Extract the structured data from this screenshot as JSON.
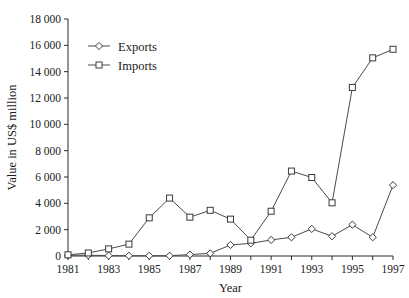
{
  "chart_data": {
    "type": "line",
    "title": "",
    "xlabel": "Year",
    "ylabel": "Value in US$ million",
    "x": [
      1981,
      1982,
      1983,
      1984,
      1985,
      1986,
      1987,
      1988,
      1989,
      1990,
      1991,
      1992,
      1993,
      1994,
      1995,
      1996,
      1997
    ],
    "xtick_labels": [
      "1981",
      "1983",
      "1985",
      "1987",
      "1989",
      "1991",
      "1993",
      "1995",
      "1997"
    ],
    "xtick_values": [
      1981,
      1983,
      1985,
      1987,
      1989,
      1991,
      1993,
      1995,
      1997
    ],
    "xlim": [
      1981,
      1997
    ],
    "ytick_labels": [
      "0",
      "2 000",
      "4 000",
      "6 000",
      "8 000",
      "10 000",
      "12 000",
      "14 000",
      "16 000",
      "18 000"
    ],
    "ytick_values": [
      0,
      2000,
      4000,
      6000,
      8000,
      10000,
      12000,
      14000,
      16000,
      18000
    ],
    "ylim": [
      0,
      18000
    ],
    "grid": false,
    "legend_position": "top-left",
    "series": [
      {
        "name": "Exports",
        "marker": "diamond",
        "values": [
          60,
          60,
          30,
          20,
          20,
          20,
          110,
          200,
          840,
          960,
          1220,
          1420,
          2060,
          1500,
          2380,
          1420,
          5380
        ]
      },
      {
        "name": "Imports",
        "marker": "square",
        "values": [
          90,
          230,
          540,
          900,
          2900,
          4400,
          2950,
          3470,
          2800,
          1200,
          3400,
          6450,
          5960,
          4040,
          12800,
          15050,
          15700
        ]
      }
    ]
  },
  "legend": {
    "items": [
      {
        "label": "Exports",
        "marker": "diamond"
      },
      {
        "label": "Imports",
        "marker": "square"
      }
    ]
  }
}
